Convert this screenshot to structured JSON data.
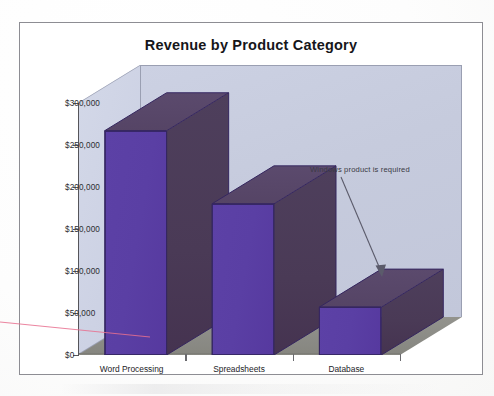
{
  "chart_data": {
    "type": "bar",
    "title": "Revenue by Product Category",
    "xlabel": "",
    "ylabel": "",
    "categories": [
      "Word Processing",
      "Spreadsheets",
      "Database"
    ],
    "values": [
      267000,
      180000,
      57000
    ],
    "ylim": [
      0,
      300000
    ],
    "ytick_values": [
      300000,
      250000,
      200000,
      150000,
      100000,
      50000,
      0
    ],
    "ytick_labels": [
      "$300,000",
      "$250,000",
      "$200,000",
      "$150,000",
      "$100,000",
      "$50,000",
      "$0"
    ],
    "grid": false,
    "legend": null,
    "three_d": true,
    "series": [
      {
        "name": "Revenue",
        "values": [
          267000,
          180000,
          57000
        ],
        "front_color": "#5a3fa4",
        "side_color": "#4a3a56",
        "top_color": "#554465"
      }
    ],
    "annotations": [
      {
        "text": "Windows product is required",
        "target_category": "Database",
        "arrow": true
      }
    ]
  },
  "chart": {
    "title": "Revenue by Product Category",
    "annotation": "Windows product is required",
    "colors": {
      "bar_front": "#5a3fa4",
      "bar_side": "#4a3a56",
      "bar_top": "#554465",
      "wall_back": "#c6cbdd",
      "wall_left": "#cdd2e4",
      "floor": "#8b8b86",
      "axis": "#55555a",
      "annotation_rule": "#e8708f",
      "frame": "#8d8d93"
    }
  }
}
